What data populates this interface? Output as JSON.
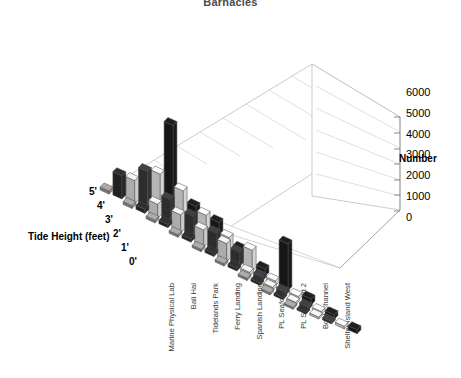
{
  "chart": {
    "title": "Barnacles",
    "number_axis_label": "Number",
    "tide_axis_label": "Tide Height (feet)"
  },
  "chart_data": {
    "type": "bar",
    "subtype": "3d-grouped-bar",
    "title": "Barnacles",
    "xlabel": "",
    "ylabel": "Number",
    "zlabel": "Tide Height (feet)",
    "ylim": [
      0,
      6000
    ],
    "yticks": [
      0,
      1000,
      2000,
      3000,
      4000,
      5000,
      6000
    ],
    "ytick_labels": [
      "0",
      "1000",
      "2000",
      "3000",
      "4000",
      "5000",
      "6000"
    ],
    "grid": true,
    "legend": "none",
    "categories": [
      "Marine Physical Lab",
      "Bali Hai",
      "Tidelands Park",
      "Ferry Landing",
      "Spanish Landing",
      "PL Seafood 1",
      "PL Seafood 2",
      "Boat Channel",
      "Shelter Island West"
    ],
    "depth_categories": [
      "0'",
      "1'",
      "2'",
      "3'",
      "4'",
      "5'"
    ],
    "series": [
      {
        "name": "5'",
        "color": "#1c1c1c",
        "values": [
          6000,
          1700,
          1600,
          800,
          450,
          3000,
          380,
          300,
          260
        ]
      },
      {
        "name": "4'",
        "color": "#e8e8e8",
        "values": [
          2550,
          2400,
          1750,
          1250,
          1350,
          300,
          240,
          190,
          170
        ]
      },
      {
        "name": "3'",
        "color": "#3a3a3a",
        "values": [
          2400,
          1500,
          1350,
          1200,
          900,
          260,
          210,
          170,
          150
        ]
      },
      {
        "name": "2'",
        "color": "#dcdcdc",
        "values": [
          1500,
          900,
          1150,
          1100,
          1150,
          230,
          190,
          150,
          130
        ]
      },
      {
        "name": "1'",
        "color": "#2b2b2b",
        "values": [
          1500,
          260,
          220,
          200,
          190,
          180,
          160,
          140,
          120
        ]
      },
      {
        "name": "0'",
        "color": "#9a9a9a",
        "values": [
          200,
          180,
          170,
          160,
          150,
          150,
          140,
          130,
          120
        ]
      }
    ]
  }
}
